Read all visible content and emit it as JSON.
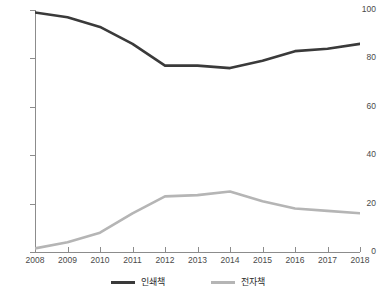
{
  "chart_data": {
    "type": "line",
    "title": "",
    "subtitle": "",
    "xlabel": "",
    "ylabel": "",
    "x": [
      2008,
      2009,
      2010,
      2011,
      2012,
      2013,
      2014,
      2015,
      2016,
      2017,
      2018
    ],
    "categories": [
      "2008",
      "2009",
      "2010",
      "2011",
      "2012",
      "2013",
      "2014",
      "2015",
      "2016",
      "2017",
      "2018"
    ],
    "series": [
      {
        "name": "인쇄책",
        "color": "#3a3a3a",
        "values": [
          99,
          97,
          93,
          86,
          77,
          77,
          76,
          79,
          83,
          84,
          86
        ]
      },
      {
        "name": "전자책",
        "color": "#b5b5b5",
        "values": [
          1.5,
          4,
          8,
          16,
          23,
          23.5,
          25,
          21,
          18,
          17,
          16
        ]
      }
    ],
    "xlim": [
      2008,
      2018
    ],
    "ylim": [
      0,
      100
    ],
    "y_ticks": [
      "0",
      "20",
      "40",
      "60",
      "80",
      "100"
    ],
    "y_tick_values": [
      0,
      20,
      40,
      60,
      80,
      100
    ],
    "grid": false,
    "legend_position": "bottom"
  },
  "legend": {
    "items": [
      {
        "label": "인쇄책",
        "color": "#3a3a3a"
      },
      {
        "label": "전자책",
        "color": "#b5b5b5"
      }
    ]
  },
  "axes": {
    "y_labels": [
      "100",
      "80",
      "60",
      "40",
      "20",
      "0"
    ],
    "x_labels": [
      "2008",
      "2009",
      "2010",
      "2011",
      "2012",
      "2013",
      "2014",
      "2015",
      "2016",
      "2017",
      "2018"
    ]
  },
  "colors": {
    "print_line": "#3a3a3a",
    "ebook_line": "#b5b5b5",
    "axis": "#8c8c8c",
    "tick_text": "#4a4a4a",
    "background": "#ffffff"
  }
}
